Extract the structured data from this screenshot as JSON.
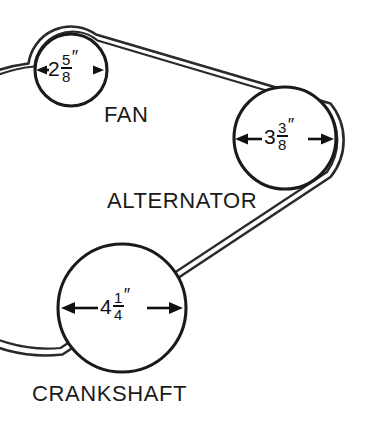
{
  "figure": {
    "kind": "engine-belt-drive-diagram",
    "background_color": "#ffffff",
    "line_color": "#1a1a1a"
  },
  "pulleys": [
    {
      "id": "fan",
      "label": "FAN",
      "diameter_text": "2 5/8″",
      "whole": "2",
      "numerator": "5",
      "denominator": "8",
      "unit_mark": "″",
      "diameter_inches": 2.625,
      "center_x": 71,
      "center_y": 70,
      "radius": 36
    },
    {
      "id": "alternator",
      "label": "ALTERNATOR",
      "diameter_text": "3 3/8″",
      "whole": "3",
      "numerator": "3",
      "denominator": "8",
      "unit_mark": "″",
      "diameter_inches": 3.375,
      "center_x": 285,
      "center_y": 138,
      "radius": 51
    },
    {
      "id": "crankshaft",
      "label": "CRANKSHAFT",
      "diameter_text": "4 1/4″",
      "whole": "4",
      "numerator": "1",
      "denominator": "4",
      "unit_mark": "″",
      "diameter_inches": 4.25,
      "center_x": 122,
      "center_y": 308,
      "radius": 64
    }
  ],
  "belt": {
    "description": "drive belt wrapped around the three pulleys",
    "stroke_color": "#2a2a2a"
  }
}
